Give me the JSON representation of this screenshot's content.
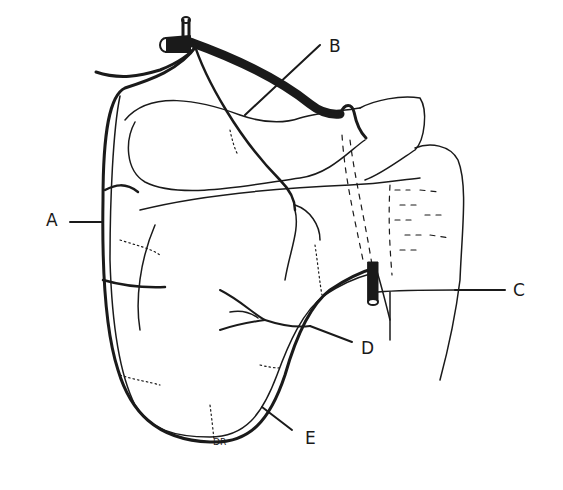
{
  "figure": {
    "type": "anatomical line drawing",
    "labels": [
      {
        "id": "A",
        "text": "A"
      },
      {
        "id": "B",
        "text": "B"
      },
      {
        "id": "C",
        "text": "C"
      },
      {
        "id": "D",
        "text": "D"
      },
      {
        "id": "E",
        "text": "E"
      }
    ],
    "signature": "DR"
  },
  "colors": {
    "ink": "#1a1a1a",
    "background": "#ffffff"
  }
}
